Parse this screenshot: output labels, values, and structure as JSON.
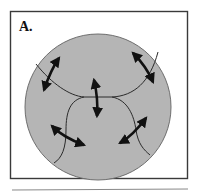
{
  "figure": {
    "panel_label": "A.",
    "colors": {
      "frame": "#3a3a3a",
      "cell_fill": "#b5b5b5",
      "cell_outline": "#6e6e6e",
      "boundary_line": "#2a2a2a",
      "arrow": "#111111"
    },
    "arrows": [
      {
        "name": "double-arrow-upper-left"
      },
      {
        "name": "double-arrow-center"
      },
      {
        "name": "double-arrow-upper-right"
      },
      {
        "name": "double-arrow-lower-left"
      },
      {
        "name": "double-arrow-lower-right"
      }
    ]
  }
}
